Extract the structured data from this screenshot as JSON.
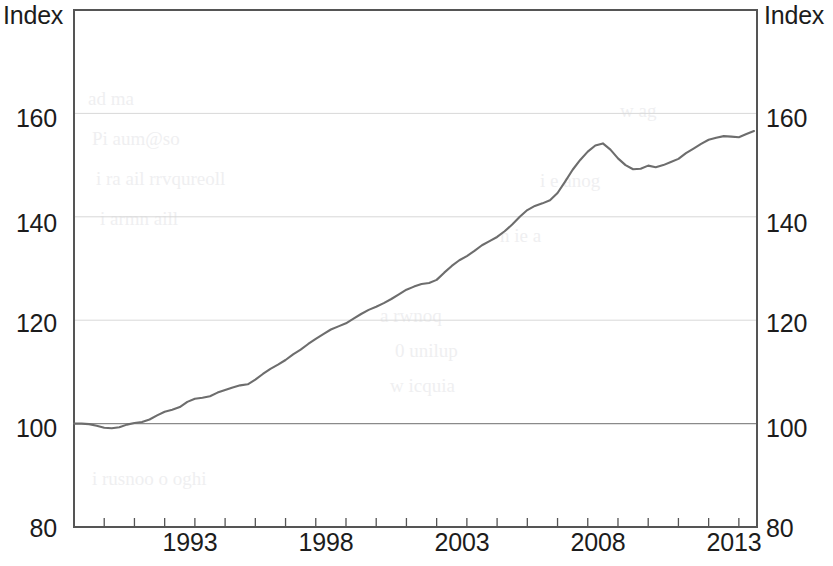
{
  "figure": {
    "axis_unit_left": "Index",
    "axis_unit_right": "Index",
    "line_color": "#6d6d6d",
    "frame_color": "#555555",
    "grid_color": "#d8d8d8"
  },
  "chart_data": {
    "type": "line",
    "title": "",
    "subtitle": "",
    "xlabel": "",
    "ylabel": "Index",
    "y2label": "Index",
    "ylim": [
      80,
      180
    ],
    "xlim": [
      1991.0,
      2013.6
    ],
    "grid": true,
    "legend": null,
    "y_ticks": [
      80,
      100,
      120,
      140,
      160
    ],
    "y_tick_labels": [
      "80",
      "100",
      "120",
      "140",
      "160"
    ],
    "x_ticks": [
      1993,
      1998,
      2003,
      2008,
      2013
    ],
    "x_tick_labels": [
      "1993",
      "1998",
      "2003",
      "2008",
      "2013"
    ],
    "x_minor_tick_interval": 1,
    "series": [
      {
        "name": "Index",
        "color": "#6d6d6d",
        "x": [
          1991.0,
          1991.25,
          1991.5,
          1991.75,
          1992.0,
          1992.25,
          1992.5,
          1992.75,
          1993.0,
          1993.25,
          1993.5,
          1993.75,
          1994.0,
          1994.25,
          1994.5,
          1994.75,
          1995.0,
          1995.25,
          1995.5,
          1995.75,
          1996.0,
          1996.25,
          1996.5,
          1996.75,
          1997.0,
          1997.25,
          1997.5,
          1997.75,
          1998.0,
          1998.25,
          1998.5,
          1998.75,
          1999.0,
          1999.25,
          1999.5,
          1999.75,
          2000.0,
          2000.25,
          2000.5,
          2000.75,
          2001.0,
          2001.25,
          2001.5,
          2001.75,
          2002.0,
          2002.25,
          2002.5,
          2002.75,
          2003.0,
          2003.25,
          2003.5,
          2003.75,
          2004.0,
          2004.25,
          2004.5,
          2004.75,
          2005.0,
          2005.25,
          2005.5,
          2005.75,
          2006.0,
          2006.25,
          2006.5,
          2006.75,
          2007.0,
          2007.25,
          2007.5,
          2007.75,
          2008.0,
          2008.25,
          2008.5,
          2008.75,
          2009.0,
          2009.25,
          2009.5,
          2009.75,
          2010.0,
          2010.25,
          2010.5,
          2010.75,
          2011.0,
          2011.25,
          2011.5,
          2011.75,
          2012.0,
          2012.25,
          2012.5,
          2012.75,
          2013.0,
          2013.25,
          2013.5
        ],
        "y": [
          100.0,
          100.0,
          99.9,
          99.6,
          99.2,
          99.1,
          99.3,
          99.8,
          100.1,
          100.3,
          100.8,
          101.6,
          102.3,
          102.7,
          103.2,
          104.2,
          104.8,
          105.0,
          105.3,
          106.0,
          106.5,
          107.0,
          107.4,
          107.6,
          108.5,
          109.6,
          110.6,
          111.4,
          112.3,
          113.4,
          114.3,
          115.4,
          116.4,
          117.3,
          118.2,
          118.8,
          119.4,
          120.3,
          121.2,
          122.0,
          122.6,
          123.3,
          124.1,
          125.0,
          125.9,
          126.5,
          127.0,
          127.2,
          127.8,
          129.2,
          130.5,
          131.6,
          132.4,
          133.4,
          134.5,
          135.3,
          136.1,
          137.2,
          138.5,
          140.0,
          141.3,
          142.1,
          142.6,
          143.2,
          144.6,
          146.8,
          149.1,
          151.0,
          152.6,
          153.8,
          154.2,
          153.0,
          151.3,
          150.0,
          149.2,
          149.3,
          149.9,
          149.6,
          150.0,
          150.6,
          151.2,
          152.3,
          153.2,
          154.1,
          154.9,
          155.3,
          155.6,
          155.5,
          155.4,
          156.0,
          156.6
        ],
        "start_value": 100.0,
        "min_value": 99.1,
        "max_value": 156.6,
        "peak_2007_value": 154.2,
        "trough_2009_value": 149.2,
        "end_value": 156.6
      }
    ]
  }
}
